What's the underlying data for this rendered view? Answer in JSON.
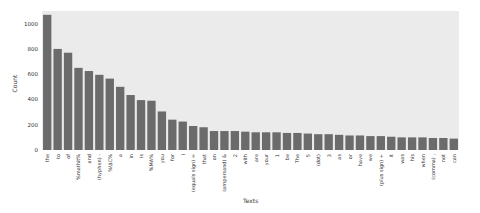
{
  "chart_data": {
    "type": "bar",
    "title": "",
    "xlabel": "Texts",
    "ylabel": "Count",
    "ylim": [
      0,
      1100
    ],
    "yticks": [
      0,
      200,
      400,
      600,
      800,
      1000
    ],
    "grid": false,
    "legend": null,
    "bar_color": "#6b6b6b",
    "plot_background": "#ebebeb",
    "categories": [
      "the",
      "to",
      "of",
      "%mathit%",
      "and",
      "(hyphen) -",
      "%\\$C%",
      "a",
      "in",
      "is",
      "%MA%",
      "you",
      "for",
      "I",
      "(equals sign) =",
      "that",
      "on",
      "(ampersand) &",
      "2",
      "with",
      "are",
      "your",
      "1",
      "be",
      "The",
      "5",
      "(dot)",
      "3",
      "as",
      "or",
      "have",
      "we",
      "(plus sign) +",
      "it",
      "was",
      "his",
      "when",
      "(comma) ,",
      "not",
      "can"
    ],
    "values": [
      1070,
      800,
      770,
      650,
      625,
      595,
      565,
      500,
      435,
      395,
      390,
      305,
      240,
      225,
      190,
      180,
      150,
      150,
      150,
      145,
      140,
      140,
      140,
      135,
      135,
      130,
      125,
      125,
      120,
      115,
      115,
      110,
      110,
      105,
      100,
      100,
      100,
      95,
      95,
      90
    ]
  }
}
